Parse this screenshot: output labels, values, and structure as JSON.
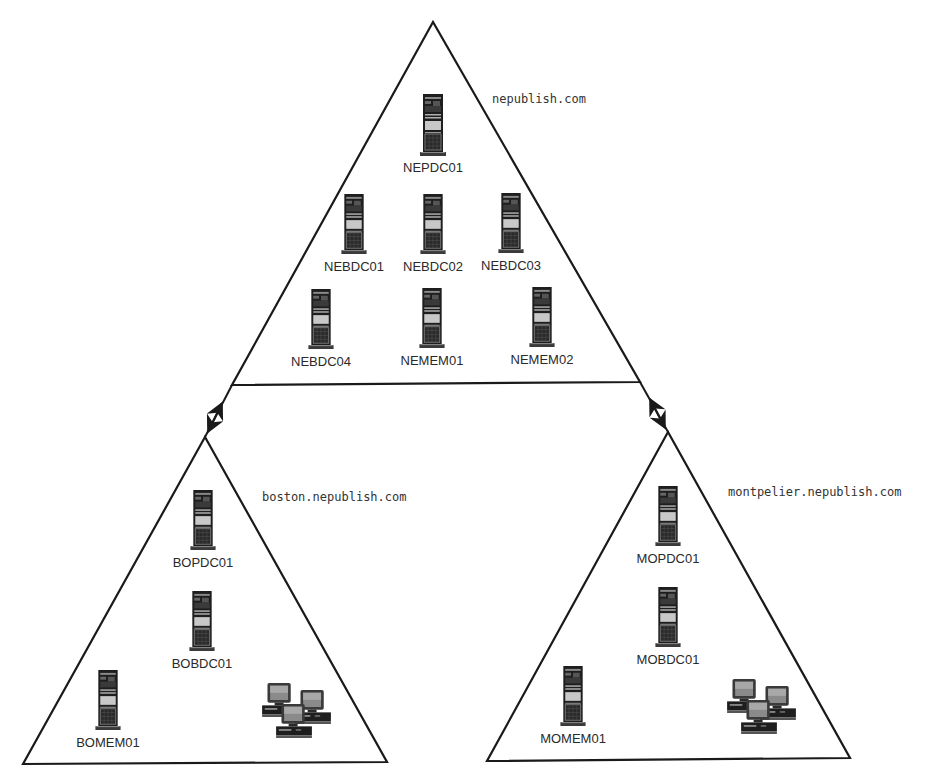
{
  "diagram": {
    "title": "",
    "domains": [
      {
        "id": "root",
        "name": "nepublish.com",
        "nodes": [
          {
            "name": "NEPDC01",
            "type": "server"
          },
          {
            "name": "NEBDC01",
            "type": "server"
          },
          {
            "name": "NEBDC02",
            "type": "server"
          },
          {
            "name": "NEBDC03",
            "type": "server"
          },
          {
            "name": "NEBDC04",
            "type": "server"
          },
          {
            "name": "NEMEM01",
            "type": "server"
          },
          {
            "name": "NEMEM02",
            "type": "server"
          }
        ]
      },
      {
        "id": "boston",
        "name": "boston.nepublish.com",
        "nodes": [
          {
            "name": "BOPDC01",
            "type": "server"
          },
          {
            "name": "BOBDC01",
            "type": "server"
          },
          {
            "name": "BOMEM01",
            "type": "server"
          },
          {
            "name": "",
            "type": "workstation-group"
          }
        ]
      },
      {
        "id": "montpelier",
        "name": "montpelier.nepublish.com",
        "nodes": [
          {
            "name": "MOPDC01",
            "type": "server"
          },
          {
            "name": "MOBDC01",
            "type": "server"
          },
          {
            "name": "MOMEM01",
            "type": "server"
          },
          {
            "name": "",
            "type": "workstation-group"
          }
        ]
      }
    ],
    "edges": [
      {
        "from": "nepublish.com",
        "to": "boston.nepublish.com",
        "type": "two-way-trust"
      },
      {
        "from": "nepublish.com",
        "to": "montpelier.nepublish.com",
        "type": "two-way-trust"
      }
    ],
    "colors": {
      "line": "#1a1a1a",
      "text": "#2a2a2a",
      "server_body": "#1e1e1e",
      "server_panel": "#c8c8c8",
      "screen": "#7a7a7a"
    }
  }
}
